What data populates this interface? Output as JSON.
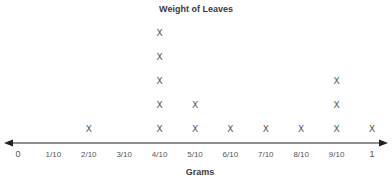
{
  "chart_data": {
    "type": "scatter",
    "subtype": "line-plot (dot plot)",
    "title": "Weight of Leaves",
    "xlabel": "Grams",
    "ylabel": "",
    "marker": "X",
    "categories": [
      "0",
      "1/10",
      "2/10",
      "3/10",
      "4/10",
      "5/10",
      "6/10",
      "7/10",
      "8/10",
      "9/10",
      "1"
    ],
    "x": [
      0,
      0.1,
      0.2,
      0.3,
      0.4,
      0.5,
      0.6,
      0.7,
      0.8,
      0.9,
      1.0
    ],
    "counts": [
      0,
      0,
      1,
      0,
      5,
      2,
      1,
      1,
      1,
      3,
      1
    ],
    "xlim": [
      0,
      1
    ],
    "axis_arrows": "both",
    "grid": false,
    "legend": "none",
    "colors": {
      "axis": "#222222",
      "marks": "#555555",
      "text": "#3a3a3a"
    }
  }
}
